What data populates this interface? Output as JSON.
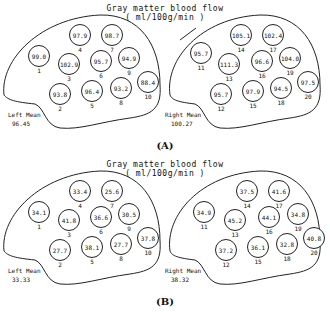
{
  "panels": [
    {
      "id": "A",
      "label": "(A)",
      "title_line1": "Gray matter blood flow",
      "title_line2": "( ml/100g/min )",
      "left": {
        "mean_label": "Left Mean",
        "mean_value": "96.45",
        "rois": [
          {
            "num": "1",
            "value": "99.0"
          },
          {
            "num": "2",
            "value": "93.8"
          },
          {
            "num": "3",
            "value": "102.9"
          },
          {
            "num": "4",
            "value": "97.9"
          },
          {
            "num": "5",
            "value": "96.4"
          },
          {
            "num": "6",
            "value": "95.7"
          },
          {
            "num": "7",
            "value": "98.7"
          },
          {
            "num": "8",
            "value": "93.2"
          },
          {
            "num": "9",
            "value": "94.9"
          },
          {
            "num": "10",
            "value": "88.4"
          }
        ]
      },
      "right": {
        "mean_label": "Right Mean",
        "mean_value": "100.27",
        "rois": [
          {
            "num": "11",
            "value": "95.7"
          },
          {
            "num": "12",
            "value": "95.7"
          },
          {
            "num": "13",
            "value": "111.3"
          },
          {
            "num": "14",
            "value": "105.1"
          },
          {
            "num": "15",
            "value": "97.9"
          },
          {
            "num": "16",
            "value": "96.6"
          },
          {
            "num": "17",
            "value": "102.4"
          },
          {
            "num": "18",
            "value": "94.5"
          },
          {
            "num": "19",
            "value": "104.0"
          },
          {
            "num": "20",
            "value": "97.5"
          }
        ]
      }
    },
    {
      "id": "B",
      "label": "(B)",
      "title_line1": "Gray matter blood flow",
      "title_line2": "( ml/100g/min )",
      "left": {
        "mean_label": "Left Mean",
        "mean_value": "33.33",
        "rois": [
          {
            "num": "1",
            "value": "34.1"
          },
          {
            "num": "2",
            "value": "27.7"
          },
          {
            "num": "3",
            "value": "41.8"
          },
          {
            "num": "4",
            "value": "33.4"
          },
          {
            "num": "5",
            "value": "38.1"
          },
          {
            "num": "6",
            "value": "36.6"
          },
          {
            "num": "7",
            "value": "25.6"
          },
          {
            "num": "8",
            "value": "27.7"
          },
          {
            "num": "9",
            "value": "30.5"
          },
          {
            "num": "10",
            "value": "37.8"
          }
        ]
      },
      "right": {
        "mean_label": "Right Mean",
        "mean_value": "38.32",
        "rois": [
          {
            "num": "11",
            "value": "34.9"
          },
          {
            "num": "12",
            "value": "37.2"
          },
          {
            "num": "13",
            "value": "45.2"
          },
          {
            "num": "14",
            "value": "37.5"
          },
          {
            "num": "15",
            "value": "36.1"
          },
          {
            "num": "16",
            "value": "44.1"
          },
          {
            "num": "17",
            "value": "41.6"
          },
          {
            "num": "18",
            "value": "32.8"
          },
          {
            "num": "19",
            "value": "34.8"
          },
          {
            "num": "20",
            "value": "40.8"
          }
        ]
      }
    }
  ]
}
